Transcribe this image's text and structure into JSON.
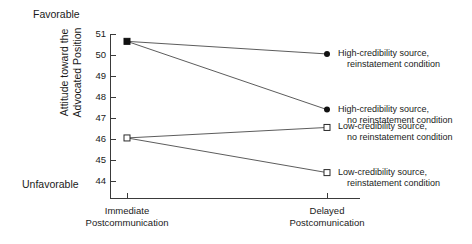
{
  "chart_data": {
    "type": "line",
    "title": "",
    "xlabel": "",
    "ylabel": "Attitude toward the Advocated Position",
    "categories": [
      "Immediate Postcommunication",
      "Delayed Postcomunication"
    ],
    "x": [
      0,
      1
    ],
    "ylim": [
      44,
      51
    ],
    "yticks": [
      51,
      50,
      49,
      48,
      47,
      46,
      45,
      44
    ],
    "ytick_labels": [
      "51",
      "50",
      "49",
      "48",
      "47",
      "46",
      "45",
      "44"
    ],
    "grid": false,
    "legend_position": "right",
    "axis_anchor_high": "Favorable",
    "axis_anchor_low": "Unfavorable",
    "series": [
      {
        "name": "High-credibility source, reinstatement condition",
        "name_line1": "High-credibility source,",
        "name_line2": "reinstatement condition",
        "marker": "filled-square-to-filled-circle",
        "values": [
          50.65,
          50.05
        ]
      },
      {
        "name": "High-credibility source, no reinstatement condition",
        "name_line1": "High-credibility source,",
        "name_line2": "no reinstatement condition",
        "marker": "filled-square-to-filled-circle",
        "values": [
          50.65,
          47.4
        ]
      },
      {
        "name": "Low-credibility source, no reinstatement condition",
        "name_line1": "Low-credibility source,",
        "name_line2": "no reinstatement condition",
        "marker": "open-square",
        "values": [
          46.05,
          46.55
        ]
      },
      {
        "name": "Low-credibility source, reinstatement condition",
        "name_line1": "Low-credibility source,",
        "name_line2": "reinstatement condition",
        "marker": "open-square",
        "values": [
          46.05,
          44.4
        ]
      }
    ],
    "colors": {
      "line": "#4a4a4a",
      "axis": "#3a3a3a",
      "marker_fill": "#111111",
      "marker_open_fill": "#ffffff",
      "text": "#1a1a1a"
    }
  },
  "y_axis_title_line1": "Attitude toward the",
  "y_axis_title_line2": "Advocated Position"
}
